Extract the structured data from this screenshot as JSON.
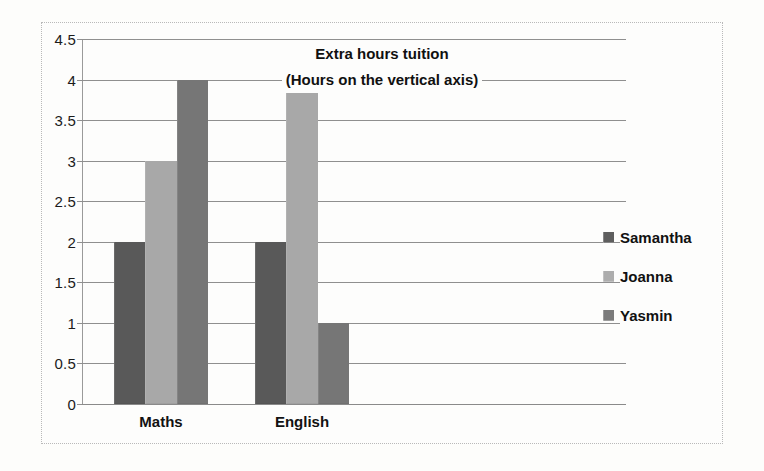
{
  "chart_data": {
    "type": "bar",
    "title": "Extra hours tuition",
    "subtitle": "(Hours on the vertical axis)",
    "xlabel": "",
    "ylabel": "Hours",
    "categories": [
      "Maths",
      "English"
    ],
    "series": [
      {
        "name": "Samantha",
        "values": [
          2,
          2
        ],
        "color": "#595959"
      },
      {
        "name": "Joanna",
        "values": [
          3,
          4
        ],
        "color": "#a8a8a8"
      },
      {
        "name": "Yasmin",
        "values": [
          4,
          1
        ],
        "color": "#767676"
      }
    ],
    "ylim": [
      0,
      4.5
    ],
    "ytick_step": 0.5,
    "yticks": [
      "0",
      "0.5",
      "1",
      "1.5",
      "2",
      "2.5",
      "3",
      "3.5",
      "4",
      "4.5"
    ],
    "grid": true,
    "legend_position": "right",
    "bar_group_fraction": 0.55
  },
  "legend": {
    "items": [
      {
        "label": "Samantha"
      },
      {
        "label": "Joanna"
      },
      {
        "label": "Yasmin"
      }
    ]
  },
  "frame": {
    "border_color": "#b9b9b9",
    "background": "#fdfdfc"
  }
}
